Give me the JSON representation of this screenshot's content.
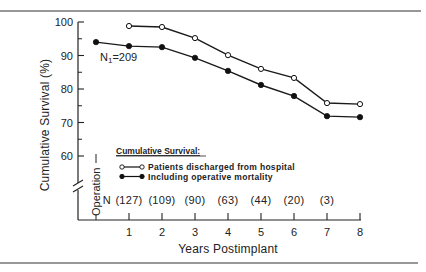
{
  "chart_data": {
    "type": "line",
    "title": "",
    "xlabel": "Years Postimplant",
    "ylabel": "Cumulative Survival (%)",
    "ylim": [
      55,
      100
    ],
    "xlim": [
      0,
      8
    ],
    "grid": false,
    "x_tick_labels": [
      "1",
      "2",
      "3",
      "4",
      "5",
      "6",
      "7",
      "8"
    ],
    "y_tick_labels": [
      "100",
      "90",
      "80",
      "70",
      "60"
    ],
    "x_origin_label": "Operation",
    "legend": {
      "title": "Cumulative Survival:",
      "position": "lower-left inside plot",
      "entries": [
        {
          "name": "Patients discharged from hospital",
          "marker": "open-circle"
        },
        {
          "name": "Including operative mortality",
          "marker": "filled-circle"
        }
      ]
    },
    "series": [
      {
        "name": "Patients discharged from hospital",
        "marker": "open-circle",
        "x": [
          1,
          2,
          3,
          4,
          5,
          6,
          7,
          8
        ],
        "values": [
          98.8,
          98.5,
          95.2,
          90.1,
          86.0,
          83.3,
          75.8,
          75.5
        ]
      },
      {
        "name": "Including operative mortality",
        "marker": "filled-circle",
        "x": [
          0,
          1,
          2,
          3,
          4,
          5,
          6,
          7,
          8
        ],
        "values": [
          94.0,
          92.8,
          92.5,
          89.3,
          85.4,
          81.2,
          77.9,
          71.9,
          71.6
        ]
      }
    ],
    "annotations": [
      {
        "text": "N",
        "subscript": "1",
        "suffix": "=209",
        "near": "year 0, 90%"
      }
    ],
    "patients_at_risk": {
      "prefix": "N",
      "labels": [
        "(127)",
        "(109)",
        "(90)",
        "(63)",
        "(44)",
        "(20)",
        "(3)"
      ],
      "years": [
        1,
        2,
        3,
        4,
        5,
        6,
        7
      ]
    },
    "axis_break": true
  }
}
